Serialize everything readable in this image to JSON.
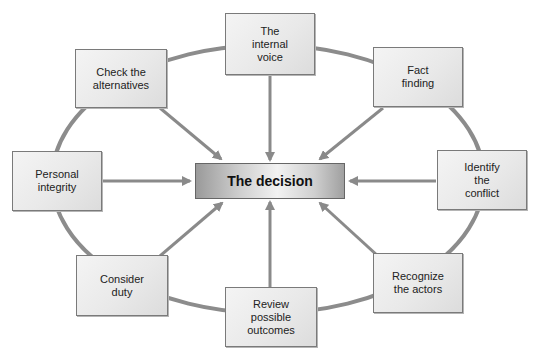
{
  "diagram": {
    "center": {
      "label": "The decision"
    },
    "nodes": [
      {
        "id": "internal-voice",
        "label": "The\ninternal\nvoice",
        "x": 225,
        "y": 13,
        "w": 90,
        "h": 62
      },
      {
        "id": "fact-finding",
        "label": "Fact\nfinding",
        "x": 373,
        "y": 47,
        "w": 90,
        "h": 60
      },
      {
        "id": "identify-conflict",
        "label": "Identify\nthe\nconflict",
        "x": 437,
        "y": 150,
        "w": 90,
        "h": 60
      },
      {
        "id": "recognize-actors",
        "label": "Recognize\nthe actors",
        "x": 373,
        "y": 253,
        "w": 90,
        "h": 60
      },
      {
        "id": "review-outcomes",
        "label": "Review\npossible\noutcomes",
        "x": 225,
        "y": 287,
        "w": 92,
        "h": 60
      },
      {
        "id": "consider-duty",
        "label": "Consider\nduty",
        "x": 76,
        "y": 255,
        "w": 92,
        "h": 61
      },
      {
        "id": "personal-integrity",
        "label": "Personal\nintegrity",
        "x": 12,
        "y": 151,
        "w": 90,
        "h": 60
      },
      {
        "id": "check-alternatives",
        "label": "Check the\nalternatives",
        "x": 75,
        "y": 49,
        "w": 92,
        "h": 59
      }
    ],
    "colors": {
      "ellipse": "#8c8c8c",
      "arrow": "#8a8a8a",
      "node_border": "#7a7a7a"
    }
  }
}
